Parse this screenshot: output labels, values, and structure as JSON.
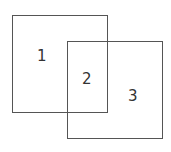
{
  "diagram": {
    "type": "overlapping-squares",
    "squares": [
      {
        "id": "A",
        "x": 12,
        "y": 15,
        "w": 96,
        "h": 98
      },
      {
        "id": "B",
        "x": 67,
        "y": 41,
        "w": 96,
        "h": 98
      }
    ],
    "regions": [
      {
        "label": "1",
        "x": 37,
        "y": 50
      },
      {
        "label": "2",
        "x": 82,
        "y": 72
      },
      {
        "label": "3",
        "x": 127,
        "y": 89
      }
    ],
    "stroke_color": "#555555"
  }
}
